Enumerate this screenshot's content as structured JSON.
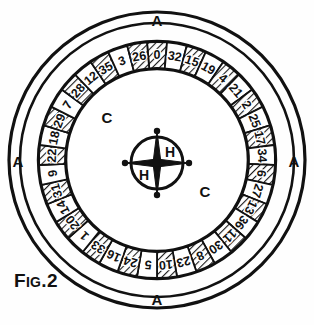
{
  "figure": {
    "caption_prefix": "F",
    "caption_small": "IG",
    "caption_suffix": ".2",
    "caption_full": "Fig.2"
  },
  "labels": {
    "outer_ring_top": "A",
    "outer_ring_bottom": "A",
    "outer_ring_left": "A",
    "outer_ring_right": "A",
    "cone_upper_left": "C",
    "cone_lower_right": "C",
    "hub_upper": "H",
    "hub_lower": "H"
  },
  "colors": {
    "ink": "#111111",
    "paper": "#fefefe",
    "pocket_light": "#ffffff",
    "pocket_dark": "#2b2b2b",
    "hatch": "#1a1a1a"
  },
  "wheel": {
    "type": "european-roulette-wheel",
    "pocket_count": 37,
    "order_clockwise_from_top": [
      {
        "number": "0",
        "shade": "dark"
      },
      {
        "number": "32",
        "shade": "light"
      },
      {
        "number": "15",
        "shade": "dark"
      },
      {
        "number": "19",
        "shade": "light"
      },
      {
        "number": "4",
        "shade": "dark"
      },
      {
        "number": "21",
        "shade": "light"
      },
      {
        "number": "2",
        "shade": "dark"
      },
      {
        "number": "25",
        "shade": "light"
      },
      {
        "number": "17",
        "shade": "dark"
      },
      {
        "number": "34",
        "shade": "light"
      },
      {
        "number": "6",
        "shade": "dark"
      },
      {
        "number": "27",
        "shade": "light"
      },
      {
        "number": "13",
        "shade": "dark"
      },
      {
        "number": "36",
        "shade": "light"
      },
      {
        "number": "11",
        "shade": "dark"
      },
      {
        "number": "30",
        "shade": "light"
      },
      {
        "number": "8",
        "shade": "dark"
      },
      {
        "number": "23",
        "shade": "light"
      },
      {
        "number": "10",
        "shade": "dark"
      },
      {
        "number": "5",
        "shade": "light"
      },
      {
        "number": "24",
        "shade": "dark"
      },
      {
        "number": "16",
        "shade": "light"
      },
      {
        "number": "33",
        "shade": "dark"
      },
      {
        "number": "1",
        "shade": "light"
      },
      {
        "number": "20",
        "shade": "dark"
      },
      {
        "number": "14",
        "shade": "light"
      },
      {
        "number": "31",
        "shade": "dark"
      },
      {
        "number": "9",
        "shade": "light"
      },
      {
        "number": "22",
        "shade": "dark"
      },
      {
        "number": "18",
        "shade": "light"
      },
      {
        "number": "29",
        "shade": "dark"
      },
      {
        "number": "7",
        "shade": "light"
      },
      {
        "number": "28",
        "shade": "dark"
      },
      {
        "number": "12",
        "shade": "light"
      },
      {
        "number": "35",
        "shade": "dark"
      },
      {
        "number": "3",
        "shade": "light"
      },
      {
        "number": "26",
        "shade": "dark"
      }
    ]
  },
  "geometry": {
    "cx": 157,
    "cy": 160,
    "r_outer_rim": 148,
    "r_outer_rim_inner": 138,
    "r_pocket_outer": 118,
    "r_pocket_inner": 92,
    "r_cone": 88,
    "r_hub": 26
  }
}
